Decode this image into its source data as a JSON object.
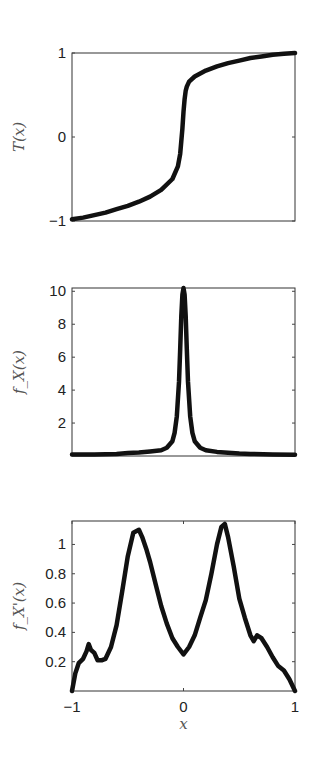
{
  "chart_data": [
    {
      "type": "line",
      "title": "",
      "xlabel": "",
      "ylabel": "T(x)",
      "xlim": [
        -1,
        1
      ],
      "ylim": [
        -1,
        1
      ],
      "yticks": [
        -1,
        0,
        1
      ],
      "ytick_labels": [
        "−1",
        "0",
        "1"
      ],
      "xticks": [],
      "grid": false,
      "box": {
        "left": 72,
        "top": 53,
        "right": 295,
        "bottom": 221
      },
      "series": [
        {
          "name": "T(x)",
          "x": [
            -1,
            -0.9,
            -0.8,
            -0.7,
            -0.6,
            -0.5,
            -0.4,
            -0.3,
            -0.2,
            -0.1,
            -0.05,
            -0.03,
            -0.02,
            -0.01,
            0,
            0.01,
            0.02,
            0.03,
            0.05,
            0.1,
            0.2,
            0.3,
            0.4,
            0.5,
            0.6,
            0.7,
            0.8,
            0.9,
            1
          ],
          "y": [
            -0.98,
            -0.96,
            -0.93,
            -0.9,
            -0.86,
            -0.82,
            -0.77,
            -0.71,
            -0.63,
            -0.5,
            -0.35,
            -0.2,
            -0.05,
            0.1,
            0.3,
            0.45,
            0.55,
            0.6,
            0.66,
            0.72,
            0.79,
            0.84,
            0.88,
            0.91,
            0.94,
            0.96,
            0.98,
            0.99,
            1.0
          ]
        }
      ]
    },
    {
      "type": "line",
      "title": "",
      "xlabel": "",
      "ylabel": "f_X(x)",
      "xlim": [
        -1,
        1
      ],
      "ylim": [
        0,
        10.2
      ],
      "yticks": [
        2,
        4,
        6,
        8,
        10
      ],
      "ytick_labels": [
        "2",
        "4",
        "6",
        "8",
        "10"
      ],
      "xticks": [],
      "grid": false,
      "box": {
        "left": 72,
        "top": 288,
        "right": 295,
        "bottom": 456
      },
      "series": [
        {
          "name": "f_X(x)",
          "x": [
            -1,
            -0.8,
            -0.6,
            -0.5,
            -0.4,
            -0.3,
            -0.2,
            -0.15,
            -0.1,
            -0.08,
            -0.06,
            -0.04,
            -0.03,
            -0.02,
            -0.01,
            0,
            0.01,
            0.02,
            0.03,
            0.04,
            0.06,
            0.08,
            0.1,
            0.15,
            0.2,
            0.3,
            0.4,
            0.5,
            0.6,
            0.8,
            1
          ],
          "y": [
            0.1,
            0.1,
            0.12,
            0.18,
            0.22,
            0.28,
            0.35,
            0.5,
            0.9,
            1.4,
            2.4,
            4.5,
            6.5,
            8.5,
            9.8,
            10.2,
            9.8,
            8.5,
            6.5,
            4.5,
            2.4,
            1.4,
            0.9,
            0.5,
            0.35,
            0.25,
            0.2,
            0.15,
            0.12,
            0.1,
            0.08
          ]
        }
      ]
    },
    {
      "type": "line",
      "title": "",
      "xlabel": "x",
      "ylabel": "f_X'(x)",
      "xlim": [
        -1,
        1
      ],
      "ylim": [
        0,
        1.16
      ],
      "yticks": [
        0.2,
        0.4,
        0.6,
        0.8,
        1
      ],
      "ytick_labels": [
        "0.2",
        "0.4",
        "0.6",
        "0.8",
        "1"
      ],
      "xticks": [
        -1,
        0,
        1
      ],
      "xtick_labels": [
        "−1",
        "0",
        "1"
      ],
      "grid": false,
      "box": {
        "left": 72,
        "top": 521,
        "right": 295,
        "bottom": 691
      },
      "series": [
        {
          "name": "f_X'(x)",
          "x": [
            -1,
            -0.97,
            -0.94,
            -0.9,
            -0.87,
            -0.85,
            -0.83,
            -0.8,
            -0.77,
            -0.73,
            -0.7,
            -0.65,
            -0.6,
            -0.55,
            -0.5,
            -0.45,
            -0.4,
            -0.37,
            -0.33,
            -0.3,
            -0.25,
            -0.2,
            -0.15,
            -0.1,
            -0.05,
            0,
            0.05,
            0.1,
            0.15,
            0.2,
            0.25,
            0.3,
            0.34,
            0.37,
            0.4,
            0.45,
            0.5,
            0.55,
            0.6,
            0.63,
            0.66,
            0.7,
            0.75,
            0.8,
            0.85,
            0.9,
            0.95,
            1
          ],
          "y": [
            0.0,
            0.12,
            0.19,
            0.22,
            0.27,
            0.32,
            0.28,
            0.26,
            0.21,
            0.21,
            0.22,
            0.3,
            0.45,
            0.68,
            0.92,
            1.08,
            1.1,
            1.05,
            0.96,
            0.88,
            0.73,
            0.58,
            0.46,
            0.36,
            0.3,
            0.25,
            0.3,
            0.38,
            0.5,
            0.62,
            0.8,
            1.0,
            1.12,
            1.14,
            1.05,
            0.85,
            0.63,
            0.5,
            0.38,
            0.34,
            0.38,
            0.36,
            0.3,
            0.23,
            0.17,
            0.14,
            0.08,
            0.0
          ]
        }
      ]
    }
  ]
}
